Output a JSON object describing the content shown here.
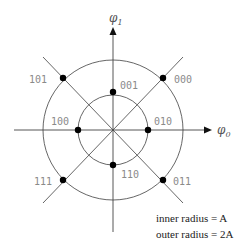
{
  "diagram": {
    "type": "8-PSK-like constellation (two-ring)",
    "axes": {
      "horizontal": {
        "symbol": "φ",
        "subscript": "0"
      },
      "vertical": {
        "symbol": "φ",
        "subscript": "1"
      }
    },
    "inner_points": [
      {
        "label": "001",
        "angle_deg": 90
      },
      {
        "label": "010",
        "angle_deg": 0
      },
      {
        "label": "110",
        "angle_deg": 270
      },
      {
        "label": "100",
        "angle_deg": 180
      }
    ],
    "outer_points": [
      {
        "label": "000",
        "angle_deg": 45
      },
      {
        "label": "101",
        "angle_deg": 135
      },
      {
        "label": "111",
        "angle_deg": 225
      },
      {
        "label": "011",
        "angle_deg": 315
      }
    ],
    "notes": {
      "inner": "inner radius = A",
      "outer": "outer radius = 2A"
    },
    "colors": {
      "lines": "#444444",
      "points": "#000000",
      "labels": "#8a8a8a"
    }
  }
}
